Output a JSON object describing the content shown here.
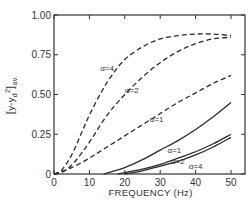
{
  "chart_data": {
    "type": "line",
    "title": "",
    "xlabel": "FREQUENCY (Hz)",
    "ylabel": "[(y - y_d)^2]_av.",
    "ylabel_parts": {
      "bracket_open": "[",
      "body": "y-y",
      "sub": "d",
      "sup": "2",
      "bracket_close": "]",
      "suffix": "av."
    },
    "xlim": [
      0,
      50
    ],
    "ylim": [
      0,
      1.0
    ],
    "grid": false,
    "legend": "inline labels",
    "x_ticks": [
      "0",
      "10",
      "20",
      "30",
      "40",
      "50"
    ],
    "y_ticks": [
      "0",
      "0.25",
      "0.50",
      "0.75",
      "1.00"
    ],
    "series": [
      {
        "name": "α=4",
        "style": "dashed",
        "x": [
          0,
          2,
          5,
          8,
          10,
          13,
          16,
          20,
          25,
          30,
          35,
          40,
          45,
          50
        ],
        "values": [
          0,
          0.02,
          0.12,
          0.27,
          0.37,
          0.5,
          0.61,
          0.72,
          0.8,
          0.85,
          0.87,
          0.88,
          0.88,
          0.87
        ]
      },
      {
        "name": "α=2",
        "style": "dashed",
        "x": [
          0,
          3,
          6,
          10,
          15,
          20,
          25,
          30,
          35,
          40,
          45,
          50
        ],
        "values": [
          0,
          0.02,
          0.08,
          0.2,
          0.37,
          0.5,
          0.61,
          0.7,
          0.77,
          0.82,
          0.85,
          0.86
        ]
      },
      {
        "name": "α=1",
        "style": "dashed",
        "x": [
          0,
          5,
          10,
          15,
          20,
          25,
          30,
          35,
          40,
          45,
          50
        ],
        "values": [
          0,
          0.04,
          0.1,
          0.17,
          0.24,
          0.31,
          0.38,
          0.45,
          0.51,
          0.57,
          0.62
        ]
      },
      {
        "name": "α=1",
        "style": "solid",
        "x": [
          14,
          20,
          25,
          30,
          35,
          40,
          45,
          50
        ],
        "values": [
          0,
          0.04,
          0.09,
          0.15,
          0.21,
          0.28,
          0.36,
          0.45
        ]
      },
      {
        "name": "α=2",
        "style": "solid",
        "x": [
          18,
          25,
          30,
          35,
          40,
          45,
          50
        ],
        "values": [
          0,
          0.03,
          0.06,
          0.1,
          0.14,
          0.19,
          0.25
        ]
      },
      {
        "name": "α=4",
        "style": "solid",
        "x": [
          20,
          25,
          30,
          35,
          40,
          45,
          50
        ],
        "values": [
          0,
          0.02,
          0.05,
          0.08,
          0.12,
          0.17,
          0.23
        ]
      }
    ],
    "annotations": [
      {
        "text": "α=4",
        "near": "dashed α=4 curve",
        "x": 15,
        "y": 0.65
      },
      {
        "text": "α=2",
        "near": "dashed α=2 curve",
        "x": 22,
        "y": 0.51
      },
      {
        "text": "α=1",
        "near": "dashed α=1 curve",
        "x": 29,
        "y": 0.33
      },
      {
        "text": "α=1",
        "near": "solid α=1 curve",
        "x": 34,
        "y": 0.13
      },
      {
        "text": "α=2",
        "near": "solid α=2 curve",
        "x": 35,
        "y": 0.06
      },
      {
        "text": "α=4",
        "near": "solid α=4 curve",
        "x": 40,
        "y": 0.03
      }
    ]
  },
  "layout": {
    "plot": {
      "left": 54,
      "top": 15,
      "right": 245,
      "bottom": 174,
      "x_at_50": 231
    }
  }
}
